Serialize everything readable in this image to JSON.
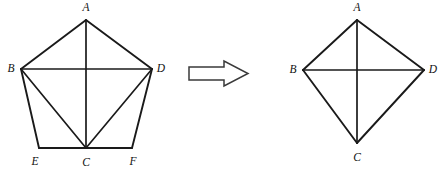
{
  "diagram": {
    "background_color": "#ffffff",
    "stroke_color": "#1a1a1a",
    "width": 443,
    "height": 172,
    "left_figure": {
      "name": "pentagon-with-diagonals",
      "shape": "pentagon",
      "vertices": [
        {
          "id": "A",
          "label": "A",
          "x": 86,
          "y": 20,
          "label_x": 86,
          "label_y": 11
        },
        {
          "id": "B",
          "label": "B",
          "x": 21,
          "y": 69,
          "label_x": 11,
          "label_y": 72
        },
        {
          "id": "D",
          "label": "D",
          "x": 152,
          "y": 69,
          "label_x": 161,
          "label_y": 72
        },
        {
          "id": "E",
          "label": "E",
          "x": 39,
          "y": 148,
          "label_x": 35,
          "label_y": 165
        },
        {
          "id": "C",
          "label": "C",
          "x": 86,
          "y": 148,
          "label_x": 86,
          "label_y": 166
        },
        {
          "id": "F",
          "label": "F",
          "x": 132,
          "y": 148,
          "label_x": 133,
          "label_y": 165
        }
      ],
      "edges": [
        {
          "name": "edge-A-B",
          "from": "A",
          "to": "B"
        },
        {
          "name": "edge-A-D",
          "from": "A",
          "to": "D"
        },
        {
          "name": "edge-B-E",
          "from": "B",
          "to": "E"
        },
        {
          "name": "edge-D-F",
          "from": "D",
          "to": "F"
        },
        {
          "name": "edge-E-F",
          "from": "E",
          "to": "F"
        },
        {
          "name": "diagonal-B-D",
          "from": "B",
          "to": "D"
        },
        {
          "name": "diagonal-A-C",
          "from": "A",
          "to": "C"
        },
        {
          "name": "diagonal-B-C",
          "from": "B",
          "to": "C"
        },
        {
          "name": "diagonal-D-C",
          "from": "D",
          "to": "C"
        }
      ]
    },
    "right_figure": {
      "name": "kite-with-diagonals",
      "shape": "kite",
      "vertices": [
        {
          "id": "A",
          "label": "A",
          "x": 357,
          "y": 20,
          "label_x": 357,
          "label_y": 11
        },
        {
          "id": "B",
          "label": "B",
          "x": 303,
          "y": 70,
          "label_x": 293,
          "label_y": 73
        },
        {
          "id": "D",
          "label": "D",
          "x": 424,
          "y": 70,
          "label_x": 433,
          "label_y": 73
        },
        {
          "id": "C",
          "label": "C",
          "x": 357,
          "y": 143,
          "label_x": 357,
          "label_y": 161
        }
      ],
      "edges": [
        {
          "name": "edge-A-B",
          "from": "A",
          "to": "B"
        },
        {
          "name": "edge-A-D",
          "from": "A",
          "to": "D"
        },
        {
          "name": "edge-B-C",
          "from": "B",
          "to": "C"
        },
        {
          "name": "edge-D-C",
          "from": "D",
          "to": "C"
        },
        {
          "name": "diagonal-B-D",
          "from": "B",
          "to": "D"
        },
        {
          "name": "diagonal-A-C",
          "from": "A",
          "to": "C"
        }
      ]
    },
    "arrow": {
      "name": "transformation-arrow",
      "direction": "right",
      "style": "hollow-outline",
      "fill_color": "#ffffff",
      "stroke_color": "#3a3a3a",
      "points": "189,67 224,67 224,61 248,73.5 224,86 224,80 189,80"
    }
  }
}
